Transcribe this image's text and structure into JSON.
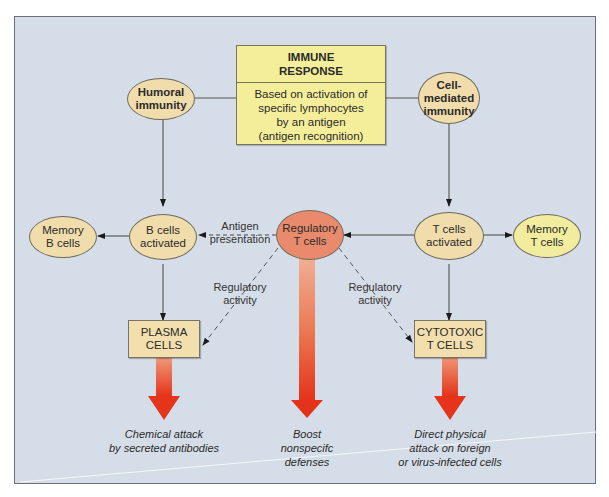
{
  "immune_response": {
    "title_line1": "IMMUNE",
    "title_line2": "RESPONSE",
    "body_lines": [
      "Based on activation of",
      "specific lymphocytes",
      "by an antigen",
      "(antigen recognition)"
    ]
  },
  "nodes": {
    "humoral": [
      "Humoral",
      "immunity"
    ],
    "cell_mediated": [
      "Cell-",
      "mediated",
      "immunity"
    ],
    "memory_b": [
      "Memory",
      "B cells"
    ],
    "b_activated": [
      "B cells",
      "activated"
    ],
    "regulatory_t": [
      "Regulatory",
      "T cells"
    ],
    "t_activated": [
      "T cells",
      "activated"
    ],
    "memory_t": [
      "Memory",
      "T cells"
    ],
    "plasma": [
      "PLASMA",
      "CELLS"
    ],
    "cytotoxic": [
      "CYTOTOXIC",
      "T CELLS"
    ]
  },
  "edge_labels": {
    "antigen_presentation": [
      "Antigen",
      "presentation"
    ],
    "regulatory_activity_left": [
      "Regulatory",
      "activity"
    ],
    "regulatory_activity_right": [
      "Regulatory",
      "activity"
    ]
  },
  "outcomes": {
    "chemical": [
      "Chemical attack",
      "by secreted antibodies"
    ],
    "boost": [
      "Boost",
      "nonspecifc",
      "defenses"
    ],
    "direct": [
      "Direct physical",
      "attack on foreign",
      "or virus-infected cells"
    ]
  },
  "colors": {
    "background": "#d5dee8",
    "ellipse": "#f1dcab",
    "memory_t": "#f2ec9f",
    "regulatory": "#e98a6c",
    "immune_box": "#f4ee9a",
    "arrow_red": "#e8391c"
  }
}
